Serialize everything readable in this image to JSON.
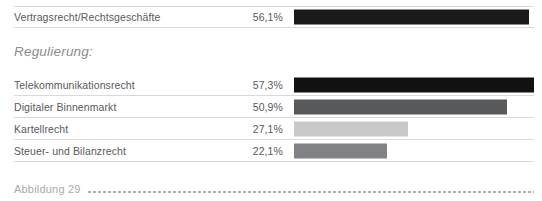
{
  "chart_data": {
    "type": "bar",
    "title": "",
    "xlabel": "",
    "ylabel": "",
    "orientation": "horizontal",
    "xlim": [
      0,
      100
    ],
    "grid": false,
    "legend": "none",
    "value_suffix": "%",
    "decimal_separator": ",",
    "sections": [
      {
        "heading": "",
        "items": [
          {
            "category": "Vertragsrecht/Rechtsgeschäfte",
            "value": 56.1,
            "value_label": "56,1%",
            "bar_color": "#1a1a1a"
          }
        ]
      },
      {
        "heading": "Regulierung:",
        "items": [
          {
            "category": "Telekommunikationsrecht",
            "value": 57.3,
            "value_label": "57,3%",
            "bar_color": "#111111"
          },
          {
            "category": "Digitaler Binnenmarkt",
            "value": 50.9,
            "value_label": "50,9%",
            "bar_color": "#58595b"
          },
          {
            "category": "Kartellrecht",
            "value": 27.1,
            "value_label": "27,1%",
            "bar_color": "#c7c8ca"
          },
          {
            "category": "Steuer- und Bilanzrecht",
            "value": 22.1,
            "value_label": "22,1%",
            "bar_color": "#808285"
          }
        ]
      }
    ]
  },
  "rows": [
    {
      "category": "Vertragsrecht/Rechtsgeschäfte",
      "value_label": "56,1%",
      "value": 56.1,
      "bar_color": "#1a1a1a"
    },
    {
      "category": "Telekommunikationsrecht",
      "value_label": "57,3%",
      "value": 57.3,
      "bar_color": "#111111"
    },
    {
      "category": "Digitaler Binnenmarkt",
      "value_label": "50,9%",
      "value": 50.9,
      "bar_color": "#58595b"
    },
    {
      "category": "Kartellrecht",
      "value_label": "27,1%",
      "value": 27.1,
      "bar_color": "#c7c8ca"
    },
    {
      "category": "Steuer- und Bilanzrecht",
      "value_label": "22,1%",
      "value": 22.1,
      "bar_color": "#808285"
    }
  ],
  "section_heading": "Regulierung:",
  "caption": {
    "text": "Abbildung 29",
    "leader": "dotted"
  },
  "colors": {
    "text": "#58595b",
    "heading": "#8a8c8e",
    "caption": "#a7a9ac",
    "rule": "#d9d9d9",
    "background": "#ffffff"
  }
}
